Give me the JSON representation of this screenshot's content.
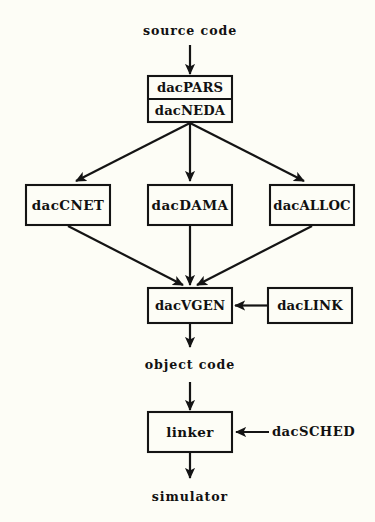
{
  "diagram": {
    "background_color": "#fdfdf6",
    "line_color": "#141414",
    "io_labels": {
      "source_code": "source code",
      "object_code": "object code",
      "simulator": "simulator"
    },
    "nodes": {
      "dacpars": "dacPARS",
      "dacneda": "dacNEDA",
      "daccnet": "dacCNET",
      "dacdama": "dacDAMA",
      "dacalloc": "dacALLOC",
      "dacvgen": "dacVGEN",
      "daclink": "dacLINK",
      "linker": "linker",
      "dacsched": "dacSCHED"
    },
    "edges": [
      {
        "from": "source code",
        "to": "dacPARS",
        "style": "straight-down"
      },
      {
        "from": "dacNEDA",
        "to": "dacCNET",
        "style": "diagonal-left"
      },
      {
        "from": "dacNEDA",
        "to": "dacDAMA",
        "style": "straight-down"
      },
      {
        "from": "dacNEDA",
        "to": "dacALLOC",
        "style": "diagonal-right"
      },
      {
        "from": "dacCNET",
        "to": "dacVGEN",
        "style": "diagonal-right"
      },
      {
        "from": "dacDAMA",
        "to": "dacVGEN",
        "style": "straight-down"
      },
      {
        "from": "dacALLOC",
        "to": "dacVGEN",
        "style": "diagonal-left"
      },
      {
        "from": "dacLINK",
        "to": "dacVGEN",
        "style": "straight-left"
      },
      {
        "from": "dacVGEN",
        "to": "object code",
        "style": "straight-down"
      },
      {
        "from": "object code",
        "to": "linker",
        "style": "straight-down"
      },
      {
        "from": "dacSCHED",
        "to": "linker",
        "style": "straight-left"
      },
      {
        "from": "linker",
        "to": "simulator",
        "style": "straight-down"
      }
    ]
  }
}
